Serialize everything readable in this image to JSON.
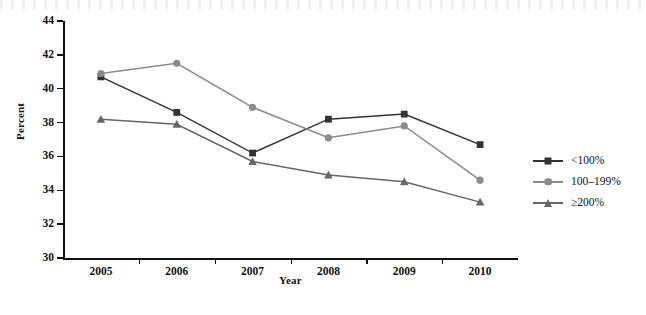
{
  "chart_data": {
    "type": "line",
    "title": "",
    "subtitle": "",
    "xlabel": "Year",
    "ylabel": "Percent",
    "categories": [
      "2005",
      "2006",
      "2007",
      "2008",
      "2009",
      "2010"
    ],
    "x": [
      2005,
      2006,
      2007,
      2008,
      2009,
      2010
    ],
    "ylim": [
      30,
      44
    ],
    "ytick_labels": [
      "30",
      "32",
      "34",
      "36",
      "38",
      "40",
      "42",
      "44"
    ],
    "ytick_values": [
      30,
      32,
      34,
      36,
      38,
      40,
      42,
      44
    ],
    "grid": false,
    "legend_position": "right",
    "series": [
      {
        "name": "<100%",
        "marker": "square",
        "color": "#333333",
        "values": [
          40.7,
          38.6,
          36.2,
          38.2,
          38.5,
          36.7
        ]
      },
      {
        "name": "100–199%",
        "marker": "circle",
        "color": "#8a8a8a",
        "values": [
          40.9,
          41.5,
          38.9,
          37.1,
          37.8,
          34.6
        ]
      },
      {
        "name": "≥200%",
        "marker": "triangle",
        "color": "#666666",
        "values": [
          38.2,
          37.9,
          35.7,
          34.9,
          34.5,
          33.3
        ]
      }
    ]
  },
  "legend": {
    "items": [
      {
        "label": "<100%",
        "icon": "square-marker-icon"
      },
      {
        "label": "100–199%",
        "icon": "circle-marker-icon"
      },
      {
        "label": "≥200%",
        "icon": "triangle-marker-icon"
      }
    ]
  },
  "axes": {
    "x_title": "Year",
    "y_title": "Percent"
  }
}
